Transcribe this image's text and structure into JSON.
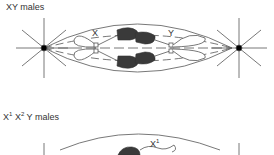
{
  "panels": [
    {
      "title": "XY males",
      "chromosome_labels": [
        "X",
        "Y"
      ]
    },
    {
      "title_parts": [
        {
          "text": "X",
          "sup": "1"
        },
        {
          "text": "X",
          "sup": "2"
        },
        {
          "text": "Y males",
          "sup": ""
        }
      ],
      "chromosome_labels": [
        {
          "text": "X",
          "sup": "1"
        }
      ]
    }
  ],
  "colors": {
    "line": "#555555",
    "dark_fill": "#3a3a3a",
    "centrosome": "#000000"
  }
}
